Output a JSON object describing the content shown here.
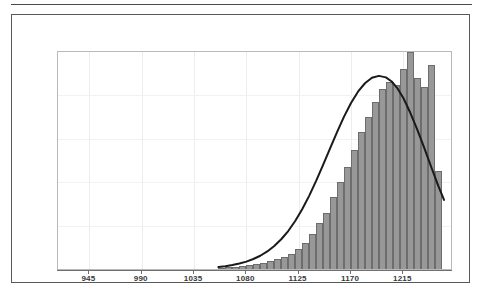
{
  "figure": {
    "has_top_rule": true,
    "frame_color": "#58585a",
    "plot_border_color": "#b9b9bb",
    "background": "#ffffff"
  },
  "chart_data": {
    "type": "bar",
    "title": "",
    "subtitle": "",
    "xlabel": "",
    "ylabel": "",
    "grid": true,
    "legend": false,
    "legend_position": "none",
    "xlim": [
      918,
      1256
    ],
    "ylim": [
      0,
      100
    ],
    "xtick_values": [
      945,
      990,
      1035,
      1080,
      1125,
      1170,
      1215
    ],
    "xtick_labels": [
      "945",
      "990",
      "1035",
      "1080",
      "1125",
      "1170",
      "1215"
    ],
    "ytick_values": [],
    "ytick_labels": [],
    "bar_fill_color": "#989898",
    "bar_edge_color": "#6d6d6d",
    "bin_width": 6,
    "bin_starts": [
      1056,
      1062,
      1068,
      1074,
      1080,
      1086,
      1092,
      1098,
      1104,
      1110,
      1116,
      1122,
      1128,
      1134,
      1140,
      1146,
      1152,
      1158,
      1164,
      1170,
      1176,
      1182,
      1188,
      1194,
      1200,
      1206,
      1212,
      1218,
      1224,
      1230,
      1236,
      1242
    ],
    "values": [
      0.6,
      0.8,
      1.1,
      1.4,
      1.8,
      2.3,
      2.9,
      3.6,
      4.4,
      5.6,
      7.0,
      9.0,
      12.0,
      16.0,
      21.0,
      26.0,
      33.0,
      40.0,
      47.0,
      55.0,
      63.0,
      70.0,
      77.0,
      83.0,
      86.0,
      85.0,
      92.0,
      100.0,
      88.0,
      84.0,
      94.0,
      45.0
    ],
    "curve": {
      "name": "normal-fit",
      "color": "#1a1a1a",
      "line_width": 2,
      "mean": 1208,
      "peak_value": 89,
      "points_x": [
        1056,
        1062,
        1068,
        1074,
        1080,
        1086,
        1092,
        1098,
        1104,
        1110,
        1116,
        1122,
        1128,
        1134,
        1140,
        1146,
        1152,
        1158,
        1164,
        1170,
        1176,
        1182,
        1188,
        1194,
        1200,
        1205,
        1210,
        1215,
        1221,
        1227,
        1233,
        1239,
        1245,
        1250
      ],
      "points_y": [
        0.9,
        1.3,
        1.8,
        2.5,
        3.4,
        4.6,
        6.1,
        8.1,
        10.6,
        13.7,
        17.5,
        22.1,
        27.5,
        33.7,
        40.6,
        48.0,
        55.6,
        63.1,
        70.2,
        76.5,
        81.7,
        85.6,
        88.1,
        89.0,
        88.3,
        86.4,
        83.2,
        78.8,
        72.0,
        64.2,
        55.8,
        47.0,
        38.4,
        31.8
      ]
    }
  }
}
